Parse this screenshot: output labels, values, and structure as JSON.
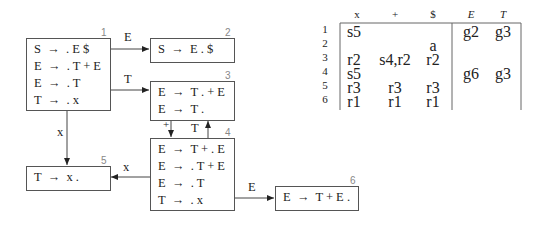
{
  "states": [
    {
      "id": "1",
      "rules": [
        "S  →  . E $",
        "E  →  . T + E",
        "E  →  . T",
        "T  →  . x"
      ]
    },
    {
      "id": "2",
      "rules": [
        "S  →  E . $"
      ]
    },
    {
      "id": "3",
      "rules": [
        "E  →  T . + E",
        "E  →  T ."
      ]
    },
    {
      "id": "4",
      "rules": [
        "E  →  T + . E",
        "E  →  . T + E",
        "E  →  . T",
        "T  →  . x"
      ]
    },
    {
      "id": "5",
      "rules": [
        "T  →  x ."
      ]
    },
    {
      "id": "6",
      "rules": [
        "E  →  T + E ."
      ]
    }
  ],
  "edges": [
    {
      "from": "1",
      "to": "2",
      "label": "E"
    },
    {
      "from": "1",
      "to": "3",
      "label": "T"
    },
    {
      "from": "1",
      "to": "5",
      "label": "x"
    },
    {
      "from": "3",
      "to": "4",
      "label": "+"
    },
    {
      "from": "4",
      "to": "3",
      "label": "T"
    },
    {
      "from": "4",
      "to": "5",
      "label": "x"
    },
    {
      "from": "4",
      "to": "6",
      "label": "E"
    }
  ],
  "table": {
    "headers": [
      "x",
      "+",
      "$",
      "E",
      "T"
    ],
    "rows": [
      {
        "state": "1",
        "cells": [
          "s5",
          "",
          "",
          "g2",
          "g3"
        ]
      },
      {
        "state": "2",
        "cells": [
          "",
          "",
          "a",
          "",
          ""
        ]
      },
      {
        "state": "3",
        "cells": [
          "r2",
          "s4,r2",
          "r2",
          "",
          ""
        ]
      },
      {
        "state": "4",
        "cells": [
          "s5",
          "",
          "",
          "g6",
          "g3"
        ]
      },
      {
        "state": "5",
        "cells": [
          "r3",
          "r3",
          "r3",
          "",
          ""
        ]
      },
      {
        "state": "6",
        "cells": [
          "r1",
          "r1",
          "r1",
          "",
          ""
        ]
      }
    ]
  }
}
